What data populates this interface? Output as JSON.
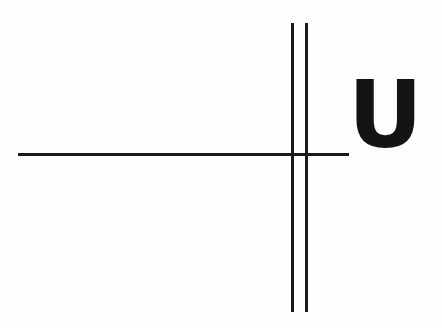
{
  "figure": {
    "background_color": "#fdfdfd",
    "ink_color": "#1a1a1a",
    "glyph_color": "#141414",
    "canvas": {
      "width": 442,
      "height": 328
    },
    "letter": {
      "character": "U",
      "description": "bold uppercase letter U",
      "x": 356,
      "y": 85,
      "width": 46,
      "height": 63
    },
    "strokes": [
      {
        "name": "horizontal-rule",
        "orientation": "horizontal",
        "x1": 18,
        "y1": 154,
        "x2": 349,
        "y2": 155,
        "thickness": 3
      },
      {
        "name": "vertical-rule-left",
        "orientation": "vertical",
        "x1": 292,
        "y1": 23,
        "x2": 293,
        "y2": 312,
        "thickness": 3
      },
      {
        "name": "vertical-rule-right",
        "orientation": "vertical",
        "x1": 306,
        "y1": 23,
        "x2": 307,
        "y2": 312,
        "thickness": 3
      }
    ],
    "intersections": [
      {
        "name": "crossing-left",
        "x": 292,
        "y": 154
      },
      {
        "name": "crossing-right",
        "x": 306,
        "y": 154
      }
    ]
  }
}
